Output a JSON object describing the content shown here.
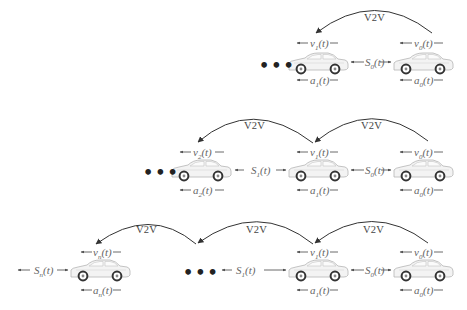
{
  "diagram": {
    "title": "",
    "v2v_label": "V2V",
    "ellipsis": "•••",
    "rows": [
      {
        "id": "platoon-2-vehicles",
        "vehicles": [
          {
            "index": "1",
            "velocity": "v1(t)",
            "acceleration": "a1(t)"
          },
          {
            "index": "0",
            "velocity": "v0(t)",
            "acceleration": "a0(t)"
          }
        ],
        "spacings": [
          {
            "label": "S0(t)"
          }
        ],
        "links": [
          {
            "label": "V2V",
            "from": "0",
            "to": "1"
          }
        ]
      },
      {
        "id": "platoon-3-vehicles",
        "vehicles": [
          {
            "index": "2",
            "velocity": "v2(t)",
            "acceleration": "a2(t)"
          },
          {
            "index": "1",
            "velocity": "v1(t)",
            "acceleration": "a1(t)"
          },
          {
            "index": "0",
            "velocity": "v0(t)",
            "acceleration": "a0(t)"
          }
        ],
        "spacings": [
          {
            "label": "S1(t)"
          },
          {
            "label": "S0(t)"
          }
        ],
        "links": [
          {
            "label": "V2V",
            "from": "1",
            "to": "2"
          },
          {
            "label": "V2V",
            "from": "0",
            "to": "1"
          }
        ]
      },
      {
        "id": "platoon-n-vehicles",
        "vehicles": [
          {
            "index": "n",
            "velocity": "vn(t)",
            "acceleration": "an(t)"
          },
          {
            "index": "1",
            "velocity": "v1(t)",
            "acceleration": "a1(t)"
          },
          {
            "index": "0",
            "velocity": "v0(t)",
            "acceleration": "a0(t)"
          }
        ],
        "spacings": [
          {
            "label": "Sn(t)"
          },
          {
            "label": "S1(t)"
          },
          {
            "label": "S0(t)"
          }
        ],
        "links": [
          {
            "label": "V2V",
            "from": "...",
            "to": "n"
          },
          {
            "label": "V2V",
            "from": "1",
            "to": "..."
          },
          {
            "label": "V2V",
            "from": "0",
            "to": "1"
          }
        ]
      }
    ],
    "text": {
      "v0": {
        "base": "v",
        "sub": "0",
        "arg": "(t)"
      },
      "v1": {
        "base": "v",
        "sub": "1",
        "arg": "(t)"
      },
      "v2": {
        "base": "v",
        "sub": "2",
        "arg": "(t)"
      },
      "vn": {
        "base": "v",
        "sub": "n",
        "arg": "(t)"
      },
      "a0": {
        "base": "a",
        "sub": "0",
        "arg": "(t)"
      },
      "a1": {
        "base": "a",
        "sub": "1",
        "arg": "(t)"
      },
      "a2": {
        "base": "a",
        "sub": "2",
        "arg": "(t)"
      },
      "an": {
        "base": "a",
        "sub": "n",
        "arg": "(t)"
      },
      "S0": {
        "base": "S",
        "sub": "0",
        "arg": "(t)"
      },
      "S1": {
        "base": "S",
        "sub": "1",
        "arg": "(t)"
      },
      "Sn": {
        "base": "S",
        "sub": "n",
        "arg": "(t)"
      }
    }
  }
}
